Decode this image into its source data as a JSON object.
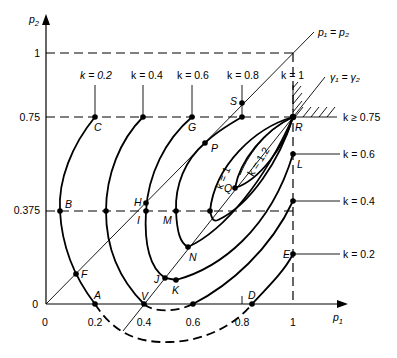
{
  "diagram": {
    "axes": {
      "x_label": "p",
      "x_sub": "1",
      "y_label": "p",
      "y_sub": "2",
      "x_ticks": [
        "0",
        "0.2",
        "0.4",
        "0.6",
        "0.8",
        "1"
      ],
      "y_ticks": [
        "0",
        "0.375",
        "0.75",
        "1"
      ]
    },
    "lines": {
      "p_equal": "p₁ = p₂",
      "gamma_equal": "γ₁ = γ₂"
    },
    "contour_labels": {
      "k02_top": "k = 0.2",
      "k04_top": "k = 0.4",
      "k06_top": "k = 0.6",
      "k08_top": "k = 0.8",
      "k1_top": "k = 1",
      "k_ge": "k ≥ 0.75",
      "k06_right": "k = 0.6",
      "k04_right": "k = 0.4",
      "k02_right": "k = 0.2",
      "k1_inner": "k = 1",
      "k12_inner": "k = 1.2"
    },
    "points": {
      "A": "A",
      "B": "B",
      "C": "C",
      "D": "D",
      "E": "E",
      "F": "F",
      "G": "G",
      "H": "H",
      "I": "I",
      "J": "J",
      "K": "K",
      "L": "L",
      "M": "M",
      "N": "N",
      "P": "P",
      "Q": "Q",
      "R": "R",
      "S": "S",
      "V": "V"
    }
  }
}
